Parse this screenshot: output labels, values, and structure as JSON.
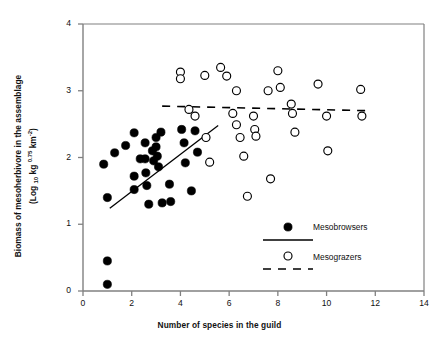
{
  "chart_data": {
    "type": "scatter",
    "title": "",
    "xlabel": "Number of species in the guild",
    "ylabel_line1": "Biomass of mesoherbivore in the assemblage",
    "ylabel_line2": "(Log 10 kg 0.75 km-2)",
    "xlim": [
      0,
      14
    ],
    "ylim": [
      0,
      4
    ],
    "xticks": [
      0,
      2,
      4,
      6,
      8,
      10,
      12,
      14
    ],
    "yticks": [
      0,
      1,
      2,
      3,
      4
    ],
    "xtick_labels": [
      "0",
      "2",
      "4",
      "6",
      "8",
      "10",
      "12",
      "14"
    ],
    "ytick_labels": [
      "0",
      "1",
      "2",
      "3",
      "4"
    ],
    "grid": false,
    "legend_position": "inside-bottom-right",
    "series": [
      {
        "name": "Mesobrowsers",
        "marker": "filled-circle",
        "color": "#000000",
        "points": [
          [
            0.85,
            1.9
          ],
          [
            1.0,
            1.4
          ],
          [
            1.0,
            0.45
          ],
          [
            1.0,
            0.1
          ],
          [
            1.3,
            2.07
          ],
          [
            1.75,
            2.18
          ],
          [
            2.1,
            2.37
          ],
          [
            2.1,
            1.72
          ],
          [
            2.1,
            1.52
          ],
          [
            2.35,
            1.98
          ],
          [
            2.55,
            2.22
          ],
          [
            2.55,
            1.98
          ],
          [
            2.58,
            1.77
          ],
          [
            2.62,
            1.58
          ],
          [
            2.7,
            1.3
          ],
          [
            2.85,
            2.1
          ],
          [
            2.9,
            1.95
          ],
          [
            3.0,
            2.3
          ],
          [
            3.0,
            2.16
          ],
          [
            3.05,
            2.02
          ],
          [
            3.1,
            1.86
          ],
          [
            3.2,
            2.38
          ],
          [
            3.25,
            1.32
          ],
          [
            3.55,
            1.6
          ],
          [
            3.6,
            1.34
          ],
          [
            4.05,
            2.42
          ],
          [
            4.15,
            2.22
          ],
          [
            4.2,
            1.92
          ],
          [
            4.45,
            1.5
          ],
          [
            4.6,
            2.4
          ],
          [
            4.7,
            2.08
          ]
        ]
      },
      {
        "name": "Mesograzers",
        "marker": "open-circle",
        "color": "#000000",
        "points": [
          [
            4.0,
            3.28
          ],
          [
            4.0,
            3.18
          ],
          [
            4.35,
            2.72
          ],
          [
            4.6,
            2.62
          ],
          [
            5.0,
            3.23
          ],
          [
            5.05,
            2.3
          ],
          [
            5.2,
            1.93
          ],
          [
            5.65,
            3.35
          ],
          [
            5.9,
            3.22
          ],
          [
            6.15,
            2.66
          ],
          [
            6.3,
            3.0
          ],
          [
            6.3,
            2.49
          ],
          [
            6.45,
            2.3
          ],
          [
            6.6,
            2.02
          ],
          [
            6.75,
            1.42
          ],
          [
            7.0,
            2.62
          ],
          [
            7.05,
            2.42
          ],
          [
            7.1,
            2.32
          ],
          [
            7.6,
            3.0
          ],
          [
            7.7,
            1.68
          ],
          [
            8.0,
            3.3
          ],
          [
            8.1,
            3.05
          ],
          [
            8.55,
            2.8
          ],
          [
            8.6,
            2.66
          ],
          [
            8.7,
            2.38
          ],
          [
            9.65,
            3.1
          ],
          [
            10.0,
            2.62
          ],
          [
            10.05,
            2.1
          ],
          [
            11.4,
            3.02
          ],
          [
            11.45,
            2.62
          ]
        ]
      }
    ],
    "trendlines": [
      {
        "name": "Mesobrowsers",
        "style": "solid",
        "x1": 1.1,
        "y1": 1.24,
        "x2": 5.55,
        "y2": 2.48
      },
      {
        "name": "Mesograzers",
        "style": "dashed",
        "x1": 3.25,
        "y1": 2.77,
        "x2": 11.8,
        "y2": 2.7
      }
    ]
  },
  "legend": {
    "items": [
      {
        "label": "Mesobrowsers",
        "marker": "filled-circle",
        "line": "solid"
      },
      {
        "label": "Mesograzers",
        "marker": "open-circle",
        "line": "dashed"
      }
    ]
  },
  "colors": {
    "axis": "#808080",
    "marker": "#000000",
    "background": "#ffffff",
    "text": "#111111"
  }
}
